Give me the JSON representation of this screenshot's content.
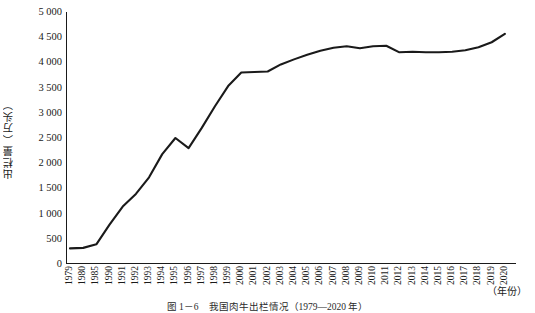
{
  "figure": {
    "caption": "图 1－6　我国肉牛出栏情况（1979—2020 年）",
    "y_axis_title": "出栏量（万头）",
    "x_axis_title": "（年份）"
  },
  "chart_data": {
    "type": "line",
    "title": "",
    "subtitle": "",
    "xlabel": "（年份）",
    "ylabel": "出栏量（万头）",
    "ylim": [
      0,
      5000
    ],
    "ytick_labels": [
      "5 000",
      "4 500",
      "4 000",
      "3 500",
      "3 000",
      "2 500",
      "2 000",
      "1 500",
      "1 000",
      "500",
      "0"
    ],
    "ytick_values": [
      5000,
      4500,
      4000,
      3500,
      3000,
      2500,
      2000,
      1500,
      1000,
      500,
      0
    ],
    "grid": false,
    "legend": "none",
    "line_color": "#1a1a1a",
    "categories": [
      "1979",
      "1980",
      "1985",
      "1990",
      "1991",
      "1992",
      "1993",
      "1994",
      "1995",
      "1996",
      "1997",
      "1998",
      "1999",
      "2000",
      "2001",
      "2002",
      "2003",
      "2004",
      "2005",
      "2006",
      "2007",
      "2008",
      "2009",
      "2010",
      "2011",
      "2012",
      "2013",
      "2014",
      "2015",
      "2016",
      "2017",
      "2018",
      "2019",
      "2020"
    ],
    "values": [
      310,
      320,
      390,
      780,
      1140,
      1390,
      1720,
      2180,
      2500,
      2300,
      2700,
      3130,
      3530,
      3800,
      3810,
      3820,
      3960,
      4060,
      4150,
      4230,
      4290,
      4320,
      4280,
      4320,
      4330,
      4200,
      4210,
      4200,
      4200,
      4210,
      4240,
      4300,
      4400,
      4565
    ],
    "annotations": [
      {
        "label": "1995 峰值",
        "x": "1995",
        "y": 2500
      },
      {
        "label": "1996 回落",
        "x": "1996",
        "y": 2300
      }
    ]
  }
}
